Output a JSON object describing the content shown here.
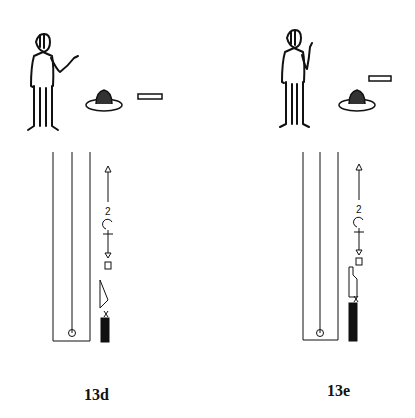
{
  "figures": [
    {
      "id": "13d",
      "label": "13d",
      "scene": "person gesturing with open palm toward a dish on a plate and a flat bar object",
      "score": {
        "symbols": [
          "up-arrow path",
          "number 2",
          "turn circle",
          "hold/spot sign",
          "down-arrow",
          "body-part sign",
          "direction pin triangle",
          "release x",
          "support column (black)",
          "start circle"
        ]
      }
    },
    {
      "id": "13e",
      "label": "13e",
      "scene": "person raising hand, dish on plate and flat bar above it",
      "score": {
        "symbols": [
          "up-arrow path",
          "number 2",
          "turn circle",
          "hold/spot sign",
          "down-arrow",
          "body-part sign",
          "flag/notch shape",
          "release x",
          "support column (black)",
          "start circle"
        ]
      }
    }
  ],
  "colors": {
    "ink": "#111111",
    "background": "#ffffff"
  }
}
